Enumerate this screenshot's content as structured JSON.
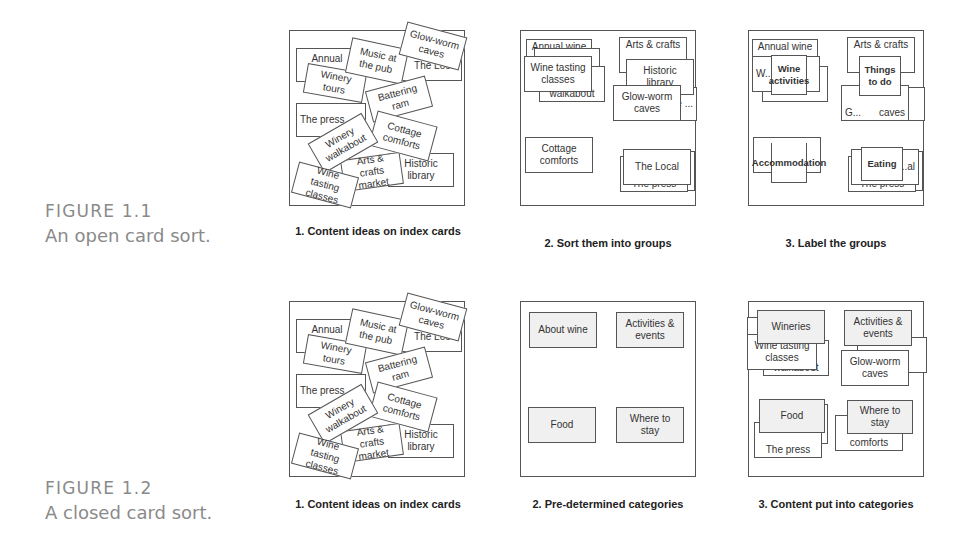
{
  "figures": [
    {
      "number": "FIGURE 1.1",
      "title": "An open card sort.",
      "panels": [
        {
          "label": "1. Content ideas on index cards",
          "cards": [
            "Annual wine",
            "Music at the pub",
            "Glow-worm caves",
            "Winery tours",
            "The Local",
            "Battering ram",
            "The press",
            "Winery walkabout",
            "Cottage comforts",
            "Arts & crafts market",
            "Historic library",
            "Wine tasting classes"
          ]
        },
        {
          "label": "2. Sort them into groups",
          "cards": [
            "Annual wine",
            "Wine tasting classes",
            "Winery walkabout",
            "Arts & crafts",
            "Historic library",
            "The ...",
            "Glow-worm caves",
            "Cottage comforts",
            "The Local",
            "The press"
          ]
        },
        {
          "label": "3. Label the groups",
          "cards": [
            "Annual wine",
            "W...",
            "Wine activities",
            "Arts & crafts",
            "Things to do",
            "G...",
            "caves",
            "Accommodation",
            "Eating",
            "...al",
            "The press"
          ]
        }
      ]
    },
    {
      "number": "FIGURE 1.2",
      "title": "A closed card sort.",
      "panels": [
        {
          "label": "1. Content ideas on index cards",
          "cards": [
            "Annual wine",
            "Music at the pub",
            "Glow-worm caves",
            "Winery tours",
            "The Local",
            "Battering ram",
            "The press",
            "Winery walkabout",
            "Cottage comforts",
            "Arts & crafts market",
            "Historic library",
            "Wine tasting classes"
          ]
        },
        {
          "label": "2. Pre-determined categories",
          "cards": [
            "About wine",
            "Activities & events",
            "Food",
            "Where to stay"
          ]
        },
        {
          "label": "3. Content put into categories",
          "cards": [
            "Wineries",
            "Wine tasting classes",
            "walkabout",
            "Activities & events",
            "Glow-worm caves",
            "Food",
            "The press",
            "Where to stay",
            "comforts"
          ]
        }
      ]
    }
  ]
}
